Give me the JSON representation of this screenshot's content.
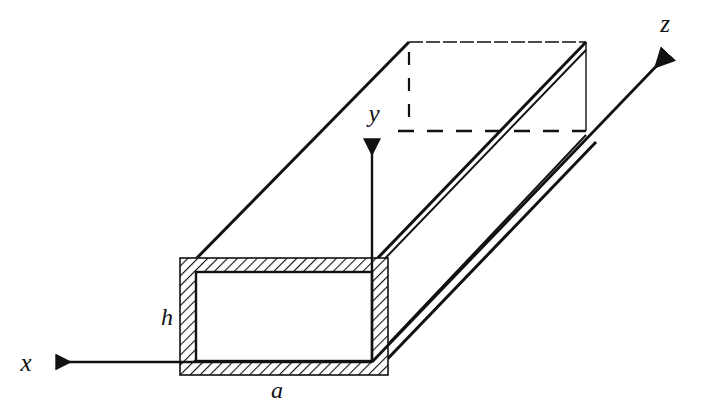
{
  "figure": {
    "kind": "rectangular-waveguide-3d-diagram",
    "background_color": "#ffffff",
    "line_color": "#111111",
    "hatch_color": "#111111"
  },
  "axes": [
    {
      "id": "x",
      "label": "x",
      "direction": "left"
    },
    {
      "id": "y",
      "label": "y",
      "direction": "up"
    },
    {
      "id": "z",
      "label": "z",
      "direction": "up-right"
    }
  ],
  "dimensions": [
    {
      "id": "a",
      "label": "a",
      "describes": "waveguide broad-wall width"
    },
    {
      "id": "h",
      "label": "h",
      "describes": "waveguide narrow-wall height"
    }
  ],
  "labels": {
    "x_axis": "x",
    "y_axis": "y",
    "z_axis": "z",
    "width": "a",
    "height": "h"
  }
}
